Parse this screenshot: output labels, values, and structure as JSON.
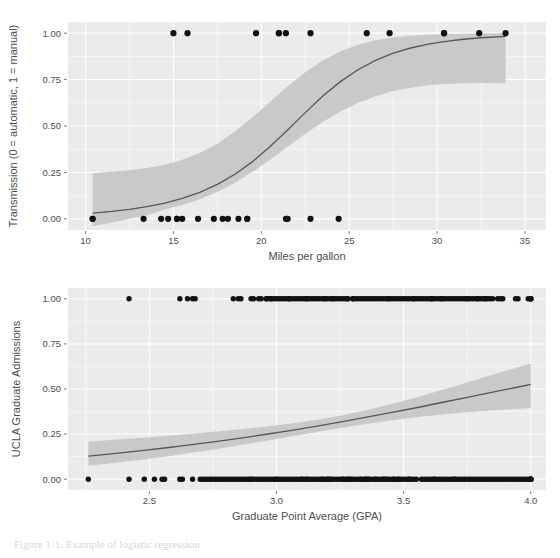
{
  "page": {
    "background": "#ffffff",
    "width": 560,
    "height": 558,
    "partial_caption": "Figure 1-1. Example of logistic regression"
  },
  "style": {
    "panel_background": "#ebebeb",
    "gridline_color": "#ffffff",
    "ribbon_color": "#c9c9c9",
    "line_color": "#54585c",
    "point_color": "#111111",
    "text_color": "#4d4d4d"
  },
  "chart_data": [
    {
      "id": "mtcars-transmission",
      "type": "scatter",
      "title": "",
      "xlabel": "Miles per gallon",
      "ylabel": "Transmission (0 = automatic, 1 = manual)",
      "xlim": [
        9.0,
        36.2
      ],
      "ylim": [
        -0.06,
        1.06
      ],
      "xticks": [
        10,
        15,
        20,
        25,
        30,
        35
      ],
      "xtick_labels": [
        "10",
        "15",
        "20",
        "25",
        "30",
        "35"
      ],
      "yticks": [
        0.0,
        0.25,
        0.5,
        0.75,
        1.0
      ],
      "ytick_labels": [
        "0.00",
        "0.25",
        "0.50",
        "0.75",
        "1.00"
      ],
      "xminor": [
        12.5,
        17.5,
        22.5,
        27.5,
        32.5
      ],
      "yminor": [
        0.125,
        0.375,
        0.625,
        0.875
      ],
      "grid": true,
      "legend": "none",
      "points": [
        {
          "x": 21.0,
          "y": 1
        },
        {
          "x": 21.0,
          "y": 1
        },
        {
          "x": 22.8,
          "y": 1
        },
        {
          "x": 21.4,
          "y": 0
        },
        {
          "x": 18.7,
          "y": 0
        },
        {
          "x": 18.1,
          "y": 0
        },
        {
          "x": 14.3,
          "y": 0
        },
        {
          "x": 24.4,
          "y": 0
        },
        {
          "x": 22.8,
          "y": 0
        },
        {
          "x": 19.2,
          "y": 0
        },
        {
          "x": 17.8,
          "y": 0
        },
        {
          "x": 16.4,
          "y": 0
        },
        {
          "x": 17.3,
          "y": 0
        },
        {
          "x": 15.2,
          "y": 0
        },
        {
          "x": 10.4,
          "y": 0
        },
        {
          "x": 10.4,
          "y": 0
        },
        {
          "x": 14.7,
          "y": 0
        },
        {
          "x": 32.4,
          "y": 1
        },
        {
          "x": 30.4,
          "y": 1
        },
        {
          "x": 33.9,
          "y": 1
        },
        {
          "x": 21.5,
          "y": 0
        },
        {
          "x": 15.5,
          "y": 0
        },
        {
          "x": 15.2,
          "y": 0
        },
        {
          "x": 13.3,
          "y": 0
        },
        {
          "x": 19.2,
          "y": 0
        },
        {
          "x": 27.3,
          "y": 1
        },
        {
          "x": 26.0,
          "y": 1
        },
        {
          "x": 30.4,
          "y": 1
        },
        {
          "x": 15.8,
          "y": 1
        },
        {
          "x": 19.7,
          "y": 1
        },
        {
          "x": 15.0,
          "y": 1
        },
        {
          "x": 21.4,
          "y": 1
        }
      ],
      "fit_curve": {
        "x": [
          10.4,
          11.5,
          12.5,
          13.5,
          14.5,
          15.5,
          16.5,
          17.5,
          18.5,
          19.5,
          20.5,
          21.5,
          22.5,
          23.5,
          24.5,
          25.5,
          26.5,
          27.5,
          28.5,
          29.5,
          30.5,
          31.5,
          32.5,
          33.9
        ],
        "y": [
          0.031,
          0.04,
          0.051,
          0.066,
          0.085,
          0.11,
          0.143,
          0.186,
          0.24,
          0.308,
          0.389,
          0.479,
          0.572,
          0.661,
          0.739,
          0.803,
          0.853,
          0.892,
          0.92,
          0.941,
          0.956,
          0.967,
          0.975,
          0.983
        ],
        "ymin": [
          -0.04,
          -0.02,
          0.0,
          0.02,
          0.05,
          0.075,
          0.105,
          0.145,
          0.195,
          0.253,
          0.318,
          0.388,
          0.458,
          0.522,
          0.578,
          0.624,
          0.66,
          0.688,
          0.706,
          0.719,
          0.726,
          0.73,
          0.731,
          0.73
        ],
        "ymax": [
          0.246,
          0.253,
          0.262,
          0.274,
          0.292,
          0.318,
          0.355,
          0.405,
          0.47,
          0.547,
          0.631,
          0.714,
          0.79,
          0.853,
          0.902,
          0.938,
          0.962,
          0.977,
          0.986,
          0.992,
          0.995,
          0.997,
          0.998,
          0.999
        ]
      }
    },
    {
      "id": "ucla-admissions",
      "type": "scatter",
      "title": "",
      "xlabel": "Graduate Point Average (GPA)",
      "ylabel": "UCLA Graduate Admissions",
      "xlim": [
        2.18,
        4.06
      ],
      "ylim": [
        -0.06,
        1.06
      ],
      "xticks": [
        2.5,
        3.0,
        3.5,
        4.0
      ],
      "xtick_labels": [
        "2.5",
        "3.0",
        "3.5",
        "4.0"
      ],
      "yticks": [
        0.0,
        0.25,
        0.5,
        0.75,
        1.0
      ],
      "ytick_labels": [
        "0.00",
        "0.25",
        "0.50",
        "0.75",
        "1.00"
      ],
      "xminor": [
        2.25,
        2.75,
        3.25,
        3.75
      ],
      "yminor": [
        0.125,
        0.375,
        0.625,
        0.875
      ],
      "grid": true,
      "legend": "none",
      "points_admitted": [
        2.42,
        2.62,
        2.65,
        2.67,
        2.68,
        2.83,
        2.85,
        2.86,
        2.9,
        2.91,
        2.93,
        2.96,
        2.96,
        2.97,
        2.98,
        2.98,
        3.0,
        3.01,
        3.02,
        3.03,
        3.04,
        3.05,
        3.06,
        3.07,
        3.08,
        3.09,
        3.1,
        3.11,
        3.12,
        3.13,
        3.14,
        3.15,
        3.16,
        3.17,
        3.18,
        3.19,
        3.2,
        3.21,
        3.22,
        3.23,
        3.24,
        3.25,
        3.26,
        3.27,
        3.28,
        3.28,
        3.3,
        3.31,
        3.32,
        3.33,
        3.34,
        3.35,
        3.36,
        3.37,
        3.38,
        3.39,
        3.4,
        3.41,
        3.42,
        3.43,
        3.44,
        3.45,
        3.46,
        3.47,
        3.48,
        3.49,
        3.5,
        3.51,
        3.52,
        3.53,
        3.54,
        3.55,
        3.56,
        3.57,
        3.58,
        3.59,
        3.6,
        3.61,
        3.62,
        3.63,
        3.64,
        3.65,
        3.66,
        3.67,
        3.68,
        3.69,
        3.7,
        3.71,
        3.72,
        3.73,
        3.74,
        3.75,
        3.76,
        3.77,
        3.78,
        3.79,
        3.8,
        3.81,
        3.82,
        3.83,
        3.84,
        3.87,
        3.88,
        3.89,
        3.94,
        3.95,
        3.99,
        4.0,
        4.0,
        4.0,
        4.0,
        3.65,
        3.3,
        3.22,
        3.19,
        3.12,
        3.05,
        2.99,
        2.94,
        3.44,
        3.54,
        3.61,
        3.75,
        3.79,
        3.82,
        3.85
      ],
      "points_rejected": [
        2.26,
        2.42,
        2.48,
        2.52,
        2.55,
        2.56,
        2.62,
        2.63,
        2.67,
        2.7,
        2.71,
        2.72,
        2.73,
        2.74,
        2.75,
        2.76,
        2.77,
        2.78,
        2.79,
        2.8,
        2.81,
        2.82,
        2.83,
        2.84,
        2.85,
        2.86,
        2.87,
        2.88,
        2.89,
        2.9,
        2.91,
        2.92,
        2.93,
        2.94,
        2.95,
        2.96,
        2.97,
        2.98,
        2.99,
        3.0,
        3.01,
        3.02,
        3.03,
        3.04,
        3.05,
        3.06,
        3.07,
        3.08,
        3.09,
        3.1,
        3.11,
        3.12,
        3.13,
        3.14,
        3.15,
        3.16,
        3.17,
        3.18,
        3.19,
        3.2,
        3.21,
        3.22,
        3.23,
        3.24,
        3.25,
        3.26,
        3.27,
        3.28,
        3.29,
        3.3,
        3.31,
        3.32,
        3.33,
        3.34,
        3.35,
        3.36,
        3.37,
        3.38,
        3.39,
        3.4,
        3.41,
        3.42,
        3.43,
        3.44,
        3.45,
        3.46,
        3.47,
        3.48,
        3.49,
        3.5,
        3.51,
        3.52,
        3.53,
        3.54,
        3.57,
        3.58,
        3.59,
        3.6,
        3.61,
        3.62,
        3.63,
        3.64,
        3.65,
        3.66,
        3.67,
        3.68,
        3.69,
        3.7,
        3.71,
        3.72,
        3.73,
        3.74,
        3.75,
        3.76,
        3.77,
        3.78,
        3.79,
        3.8,
        3.81,
        3.82,
        3.83,
        3.84,
        3.85,
        3.86,
        3.87,
        3.88,
        3.89,
        3.9,
        3.91,
        3.92,
        3.93,
        3.94,
        3.95,
        3.96,
        3.97,
        3.98,
        3.99,
        4.0,
        4.0,
        4.0,
        4.0,
        4.0,
        4.0,
        2.9,
        3.0,
        3.1,
        3.2,
        3.28,
        3.35,
        3.42,
        3.48,
        3.55,
        3.62,
        3.7,
        3.12,
        3.18,
        3.26,
        3.33,
        3.39,
        3.46,
        3.52,
        3.21,
        3.29,
        3.36,
        3.43
      ],
      "fit_curve": {
        "x": [
          2.26,
          2.36,
          2.46,
          2.56,
          2.66,
          2.76,
          2.86,
          2.96,
          3.06,
          3.16,
          3.26,
          3.36,
          3.46,
          3.56,
          3.66,
          3.76,
          3.86,
          3.96,
          4.0
        ],
        "y": [
          0.128,
          0.142,
          0.157,
          0.173,
          0.19,
          0.208,
          0.228,
          0.249,
          0.271,
          0.294,
          0.319,
          0.345,
          0.372,
          0.399,
          0.428,
          0.456,
          0.485,
          0.514,
          0.526
        ],
        "ymin": [
          0.075,
          0.09,
          0.107,
          0.125,
          0.145,
          0.166,
          0.189,
          0.213,
          0.238,
          0.262,
          0.286,
          0.308,
          0.328,
          0.345,
          0.36,
          0.372,
          0.382,
          0.391,
          0.394
        ],
        "ymax": [
          0.208,
          0.218,
          0.228,
          0.24,
          0.251,
          0.264,
          0.277,
          0.292,
          0.309,
          0.33,
          0.355,
          0.385,
          0.419,
          0.457,
          0.498,
          0.54,
          0.583,
          0.625,
          0.641
        ]
      }
    }
  ]
}
